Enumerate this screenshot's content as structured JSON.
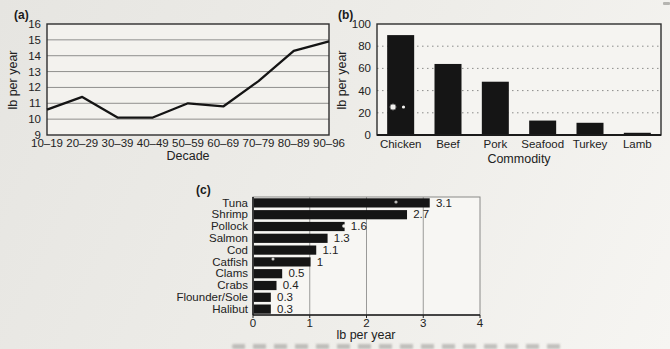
{
  "figure": {
    "panels": {
      "a": "(a)",
      "b": "(b)",
      "c": "(c)"
    }
  },
  "chart_data": [
    {
      "panel": "(a)",
      "type": "line",
      "title": "",
      "xlabel": "Decade",
      "ylabel": "lb per year",
      "categories": [
        "10–19",
        "20–29",
        "30–39",
        "40–49",
        "50–59",
        "60–69",
        "70–79",
        "80–89",
        "90–96"
      ],
      "values": [
        10.6,
        11.4,
        10.1,
        10.1,
        11.0,
        10.8,
        12.4,
        14.3,
        14.9
      ],
      "ylim": [
        9,
        16
      ],
      "yticks": [
        9,
        10,
        11,
        12,
        13,
        14,
        15,
        16
      ],
      "grid": "horizontal-solid",
      "legend": "none"
    },
    {
      "panel": "(b)",
      "type": "bar",
      "title": "",
      "xlabel": "Commodity",
      "ylabel": "lb per year",
      "categories": [
        "Chicken",
        "Beef",
        "Pork",
        "Seafood",
        "Turkey",
        "Lamb"
      ],
      "values": [
        90,
        64,
        48,
        13,
        11,
        2
      ],
      "ylim": [
        0,
        100
      ],
      "yticks": [
        0,
        20,
        40,
        60,
        80,
        100
      ],
      "grid": "horizontal-dashed",
      "legend": "none"
    },
    {
      "panel": "(c)",
      "type": "bar-horizontal",
      "title": "",
      "xlabel": "lb per year",
      "ylabel": "",
      "categories": [
        "Tuna",
        "Shrimp",
        "Pollock",
        "Salmon",
        "Cod",
        "Catfish",
        "Clams",
        "Crabs",
        "Flounder/Sole",
        "Halibut"
      ],
      "values": [
        3.1,
        2.7,
        1.6,
        1.3,
        1.1,
        1,
        0.5,
        0.4,
        0.3,
        0.3
      ],
      "value_labels": [
        "3.1",
        "2.7",
        "1.6",
        "1.3",
        "1.1",
        "1",
        "0.5",
        "0.4",
        "0.3",
        "0.3"
      ],
      "xlim": [
        0,
        4
      ],
      "xticks": [
        0,
        1,
        2,
        3,
        4
      ],
      "grid": "vertical-solid",
      "legend": "none"
    }
  ]
}
